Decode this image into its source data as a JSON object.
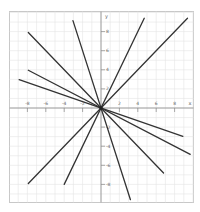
{
  "chart_data": {
    "type": "line",
    "title": "",
    "xlabel": "x",
    "ylabel": "y",
    "xlim": [
      -10,
      10
    ],
    "ylim": [
      -10,
      10
    ],
    "grid": true,
    "legend": null,
    "x_ticks": [
      -8,
      -6,
      -4,
      -2,
      2,
      4,
      6,
      8
    ],
    "y_ticks": [
      8,
      6,
      4,
      2,
      -2,
      -4,
      -6,
      -8
    ],
    "x_tick_labels": [
      "-8",
      "-6",
      "-4",
      "-2",
      "2",
      "4",
      "6",
      "8"
    ],
    "y_tick_labels": [
      "8",
      "6",
      "4",
      "2",
      "-2",
      "-4",
      "-6",
      "-8"
    ],
    "series": [
      {
        "name": "y = -3x",
        "slope": -3,
        "x_range": [
          -3.05,
          3.2
        ]
      },
      {
        "name": "y = 2x",
        "slope": 2,
        "x_range": [
          -4,
          4.7
        ]
      },
      {
        "name": "y = x",
        "slope": 1,
        "x_range": [
          -7.9,
          9.4
        ]
      },
      {
        "name": "y = -x",
        "slope": -1,
        "x_range": [
          -7.9,
          6.8
        ]
      },
      {
        "name": "y = -0.5x",
        "slope": -0.5,
        "x_range": [
          -7.9,
          9.7
        ]
      },
      {
        "name": "y = -x/3",
        "slope": -0.3333,
        "x_range": [
          -8.9,
          8.9
        ]
      }
    ],
    "colors": {
      "line": "#333333",
      "axis": "#888888",
      "grid": "#e4e4e4",
      "frame": "#c8c8c8",
      "tick_label": "#666666"
    }
  }
}
